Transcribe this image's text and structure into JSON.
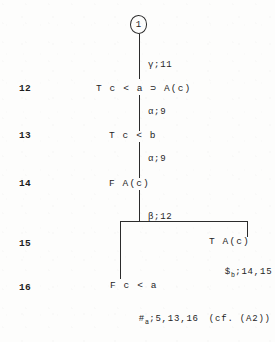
{
  "diagram": {
    "ink_color": "#2b2b2b",
    "root_node": {
      "label": "1",
      "shape": "circle"
    },
    "line_numbers": [
      {
        "label": "12"
      },
      {
        "label": "13"
      },
      {
        "label": "14"
      },
      {
        "label": "15"
      },
      {
        "label": "16"
      }
    ],
    "formulas": [
      {
        "text": "T c < a ⊃ A(c)"
      },
      {
        "text": "T c < b"
      },
      {
        "text": "F A(c)"
      },
      {
        "text": "T A(c)"
      },
      {
        "text": "F c < a"
      }
    ],
    "rule_labels": [
      {
        "text": "γ;11"
      },
      {
        "text": "α;9"
      },
      {
        "text": "α;9"
      },
      {
        "text": "β;12"
      }
    ],
    "closures": [
      {
        "symbol": "$",
        "subscript": "b",
        "refs": ";14,15"
      },
      {
        "symbol": "#",
        "subscript": "a",
        "refs": ";5,13,16",
        "note": "(cf. (A2))"
      }
    ]
  }
}
